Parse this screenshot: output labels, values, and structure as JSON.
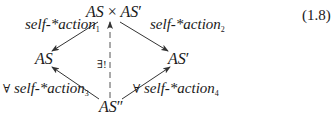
{
  "equation_number": "(1.8)",
  "nodes": {
    "top": {
      "left": "AS",
      "op": "×",
      "right": "AS",
      "right_prime": "′"
    },
    "left": {
      "label": "AS"
    },
    "right": {
      "label": "AS",
      "prime": "′"
    },
    "bottom": {
      "label": "AS",
      "prime": "″"
    }
  },
  "arrows": {
    "top_to_left": {
      "label": "self-*action",
      "sub": "1"
    },
    "top_to_right": {
      "label": "self-*action",
      "sub": "2"
    },
    "bottom_to_left": {
      "quantifier": "∀",
      "label": "self-*action",
      "sub": "3"
    },
    "bottom_to_right": {
      "quantifier": "∀",
      "label": "self-*action",
      "sub": "4"
    },
    "bottom_to_top": {
      "label": "∃!",
      "style": "dashed"
    }
  },
  "colors": {
    "ink": "#1a1a1a",
    "arrow": "#333333",
    "dashed": "#555555"
  }
}
